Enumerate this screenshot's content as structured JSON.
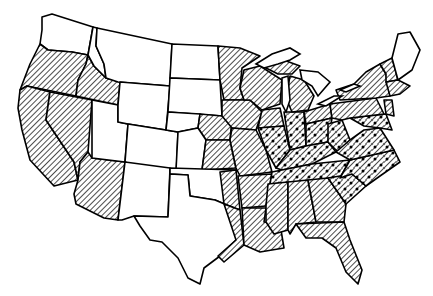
{
  "map": {
    "region": "Contiguous United States",
    "legend_visible": false,
    "colors": {
      "background": "#ffffff",
      "outline": "#000000",
      "hatch_line": "#000000"
    },
    "patterns": {
      "none": "plain white (no fill)",
      "hatched": "diagonal line hatching",
      "dotted": "diagonal hatching with dot stippling"
    },
    "states": {
      "hatched": [
        "WA-south/OR",
        "OR",
        "ID-south",
        "CA",
        "NV",
        "AZ",
        "NE-east",
        "KS-east",
        "MN",
        "IA",
        "WI",
        "MI",
        "MO",
        "AR",
        "LA",
        "MS",
        "AL",
        "GA",
        "FL",
        "NY",
        "VT",
        "NH",
        "MA",
        "CT",
        "RI",
        "PA",
        "NJ",
        "IL-north",
        "IN-north",
        "OH-north",
        "OK-east",
        "TX-east"
      ],
      "dotted": [
        "IL-south",
        "IN",
        "KY",
        "OH-south",
        "WV",
        "TN",
        "VA",
        "NC",
        "SC",
        "MD",
        "DE"
      ],
      "none": [
        "WA",
        "MT",
        "ID-north",
        "WY",
        "ND",
        "SD",
        "NE-west",
        "CO",
        "UT",
        "NM",
        "KS-west",
        "OK",
        "TX",
        "ME"
      ]
    }
  }
}
